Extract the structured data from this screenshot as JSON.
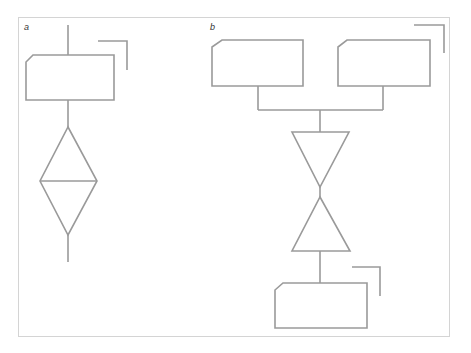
{
  "panels": {
    "a": {
      "label": "a"
    },
    "b": {
      "label": "b"
    }
  },
  "colors": {
    "stroke": "#9a9a9a",
    "frame": "#d4d4d4",
    "background": "#ffffff"
  }
}
